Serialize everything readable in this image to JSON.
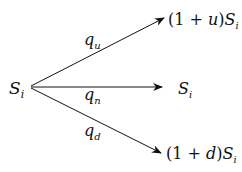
{
  "diagram": {
    "root": {
      "var": "S",
      "sub": "i"
    },
    "branches": [
      {
        "prob": {
          "var": "q",
          "sub": "u"
        },
        "outcome_prefix": "(1 + ",
        "outcome_param": "u",
        "outcome_suffix": ")",
        "outcome_var": "S",
        "outcome_sub": "i"
      },
      {
        "prob": {
          "var": "q",
          "sub": "n"
        },
        "outcome_prefix": "",
        "outcome_param": "",
        "outcome_suffix": "",
        "outcome_var": "S",
        "outcome_sub": "i"
      },
      {
        "prob": {
          "var": "q",
          "sub": "d"
        },
        "outcome_prefix": "(1 + ",
        "outcome_param": "d",
        "outcome_suffix": ")",
        "outcome_var": "S",
        "outcome_sub": "i"
      }
    ]
  }
}
